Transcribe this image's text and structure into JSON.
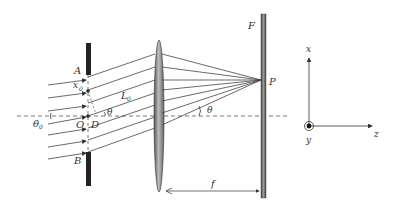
{
  "diagram": {
    "type": "optics-diffraction-setup",
    "labels": {
      "A": "A",
      "B": "B",
      "O": "O",
      "D": "D",
      "x0": "x",
      "x0_sub": "0",
      "L0": "L",
      "L0_sub": "0",
      "theta": "θ",
      "theta0": "θ",
      "theta0_sub": "0",
      "theta_screen": "θ",
      "F": "F",
      "P": "P",
      "f": "f",
      "axis_x": "x",
      "axis_y": "y",
      "axis_z": "z"
    },
    "components": [
      "slit-screen",
      "converging-lens",
      "focal-screen-F",
      "coordinate-axes"
    ],
    "incident_rays": 7,
    "rays_to_P": 7
  }
}
